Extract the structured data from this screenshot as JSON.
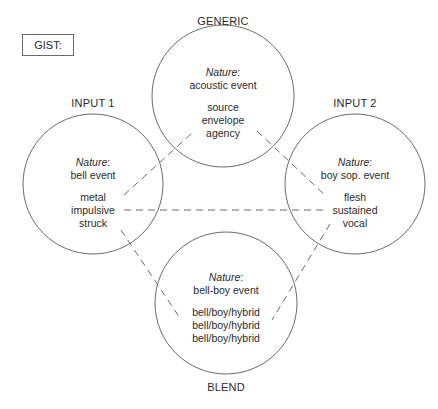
{
  "gist_label": "GIST:",
  "spaces": {
    "generic": {
      "title": "GENERIC",
      "nature_label": "Nature",
      "nature_value": "acoustic event",
      "features": [
        "source",
        "envelope",
        "agency"
      ]
    },
    "input1": {
      "title": "INPUT 1",
      "nature_label": "Nature",
      "nature_value": "bell event",
      "features": [
        "metal",
        "impulsive",
        "struck"
      ]
    },
    "input2": {
      "title": "INPUT 2",
      "nature_label": "Nature",
      "nature_value": "boy sop. event",
      "features": [
        "flesh",
        "sustained",
        "vocal"
      ]
    },
    "blend": {
      "title": "BLEND",
      "nature_label": "Nature",
      "nature_value": "bell-boy event",
      "features": [
        "bell/boy/hybrid",
        "bell/boy/hybrid",
        "bell/boy/hybrid"
      ]
    }
  },
  "connections": [
    {
      "from": "input1",
      "to": "generic"
    },
    {
      "from": "input1",
      "to": "input2"
    },
    {
      "from": "input1",
      "to": "blend"
    },
    {
      "from": "input2",
      "to": "generic"
    },
    {
      "from": "input2",
      "to": "blend"
    }
  ]
}
